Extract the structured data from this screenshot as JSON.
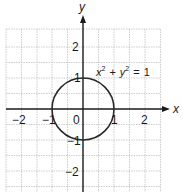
{
  "figure": {
    "equation": {
      "x_var": "x",
      "y_var": "y",
      "exp": "2",
      "plus": "+",
      "equals": "=",
      "rhs": "1"
    },
    "axes": {
      "x_label": "x",
      "y_label": "y"
    },
    "x_ticks": [
      {
        "value": -2,
        "label": "−2"
      },
      {
        "value": -1,
        "label": "−1"
      },
      {
        "value": 0,
        "label": "0"
      },
      {
        "value": 1,
        "label": "1"
      },
      {
        "value": 2,
        "label": "2"
      }
    ],
    "y_ticks": [
      {
        "value": 2,
        "label": "2"
      },
      {
        "value": 1,
        "label": "1"
      },
      {
        "value": -1,
        "label": "−1"
      },
      {
        "value": -2,
        "label": "−2"
      }
    ],
    "grid": {
      "x_range": [
        -2.5,
        2.5
      ],
      "y_range": [
        -2.6,
        2.6
      ],
      "step": 0.5
    },
    "curve": {
      "type": "circle",
      "center": [
        0,
        0
      ],
      "radius": 1
    },
    "colors": {
      "grid": "#b8b8b8",
      "axis": "#1a1a1a",
      "curve": "#2a2a2a"
    }
  }
}
